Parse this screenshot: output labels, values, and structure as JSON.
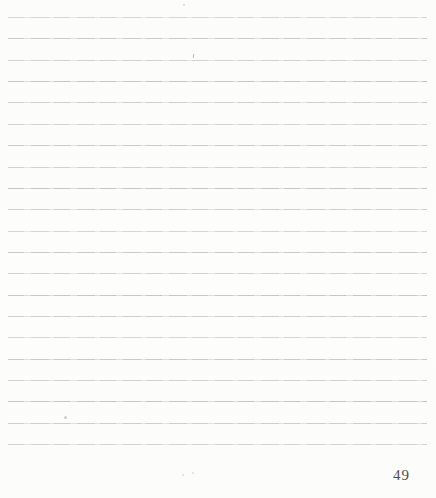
{
  "page": {
    "type": "blank-ruled-notebook-page",
    "number": "49",
    "ruled_lines": {
      "count": 21,
      "first_top_px": 17,
      "spacing_px": 21.35,
      "left_px": 8,
      "right_px": 9
    }
  },
  "colors": {
    "background": "#fcfcfb",
    "background_alt": "#fdfdfc",
    "rule_line": "#c4c8c4",
    "rule_line_light": "#dcdedc",
    "page_number": "#4d4d4d"
  }
}
